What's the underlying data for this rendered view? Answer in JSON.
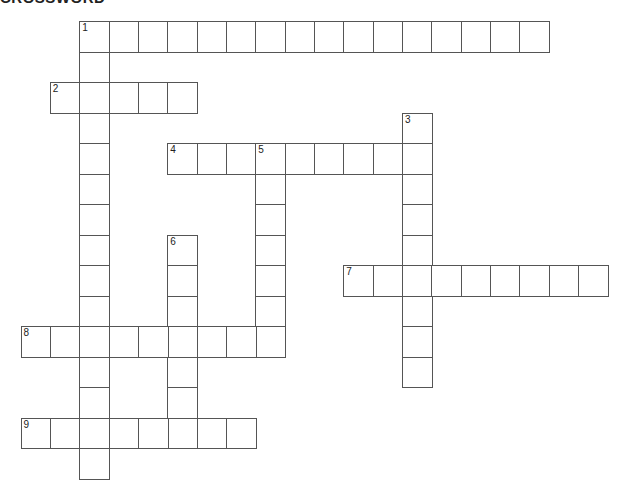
{
  "title": "CROSSWORD",
  "grid": {
    "origin_x": 20.5,
    "origin_y": 21,
    "cell_w": 29.35,
    "cell_h": 30.5
  },
  "entries": [
    {
      "number": "1",
      "direction": "across",
      "row": 0,
      "col": 2,
      "length": 16
    },
    {
      "number": "1",
      "direction": "down",
      "row": 0,
      "col": 2,
      "length": 15
    },
    {
      "number": "2",
      "direction": "across",
      "row": 2,
      "col": 1,
      "length": 5
    },
    {
      "number": "3",
      "direction": "down",
      "row": 3,
      "col": 13,
      "length": 9
    },
    {
      "number": "4",
      "direction": "across",
      "row": 4,
      "col": 5,
      "length": 9
    },
    {
      "number": "5",
      "direction": "down",
      "row": 4,
      "col": 8,
      "length": 7
    },
    {
      "number": "6",
      "direction": "down",
      "row": 7,
      "col": 5,
      "length": 7
    },
    {
      "number": "7",
      "direction": "across",
      "row": 8,
      "col": 11,
      "length": 9
    },
    {
      "number": "8",
      "direction": "across",
      "row": 10,
      "col": 0,
      "length": 9
    },
    {
      "number": "9",
      "direction": "across",
      "row": 13,
      "col": 0,
      "length": 8
    }
  ],
  "colors": {
    "line": "#555555",
    "background": "#ffffff",
    "text": "#222222"
  }
}
